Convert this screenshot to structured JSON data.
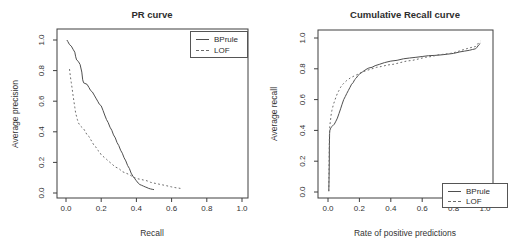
{
  "figure": {
    "background": "#ffffff",
    "frame_color": "#3f3f3f",
    "text_color": "#333333"
  },
  "chart_data": [
    {
      "type": "line",
      "title": "PR curve",
      "xlabel": "Recall",
      "ylabel": "Average precision",
      "xlim": [
        0.0,
        1.0
      ],
      "ylim": [
        0.0,
        1.0
      ],
      "grid": false,
      "legend_position": "top-right",
      "legend_labels": [
        "BPrule",
        "LOF"
      ],
      "xticks": [
        "0.0",
        "0.2",
        "0.4",
        "0.6",
        "0.8",
        "1.0"
      ],
      "yticks": [
        "0.0",
        "0.2",
        "0.4",
        "0.6",
        "0.8",
        "1.0"
      ],
      "series": [
        {
          "name": "BPrule",
          "style": "solid",
          "color": "#4f4f4f",
          "points": [
            [
              0.005,
              1.0
            ],
            [
              0.01,
              0.99
            ],
            [
              0.02,
              0.97
            ],
            [
              0.03,
              0.96
            ],
            [
              0.04,
              0.94
            ],
            [
              0.05,
              0.92
            ],
            [
              0.055,
              0.89
            ],
            [
              0.06,
              0.87
            ],
            [
              0.07,
              0.86
            ],
            [
              0.08,
              0.84
            ],
            [
              0.09,
              0.79
            ],
            [
              0.095,
              0.74
            ],
            [
              0.1,
              0.72
            ],
            [
              0.12,
              0.71
            ],
            [
              0.13,
              0.69
            ],
            [
              0.14,
              0.67
            ],
            [
              0.15,
              0.66
            ],
            [
              0.16,
              0.64
            ],
            [
              0.17,
              0.62
            ],
            [
              0.18,
              0.6
            ],
            [
              0.19,
              0.58
            ],
            [
              0.2,
              0.57
            ],
            [
              0.21,
              0.54
            ],
            [
              0.22,
              0.51
            ],
            [
              0.23,
              0.48
            ],
            [
              0.24,
              0.46
            ],
            [
              0.25,
              0.43
            ],
            [
              0.26,
              0.41
            ],
            [
              0.27,
              0.38
            ],
            [
              0.28,
              0.36
            ],
            [
              0.29,
              0.33
            ],
            [
              0.3,
              0.31
            ],
            [
              0.31,
              0.28
            ],
            [
              0.32,
              0.26
            ],
            [
              0.33,
              0.23
            ],
            [
              0.34,
              0.21
            ],
            [
              0.35,
              0.18
            ],
            [
              0.36,
              0.16
            ],
            [
              0.37,
              0.13
            ],
            [
              0.38,
              0.11
            ],
            [
              0.39,
              0.095
            ],
            [
              0.4,
              0.08
            ],
            [
              0.41,
              0.065
            ],
            [
              0.42,
              0.055
            ],
            [
              0.43,
              0.05
            ],
            [
              0.44,
              0.045
            ],
            [
              0.45,
              0.04
            ],
            [
              0.46,
              0.035
            ],
            [
              0.47,
              0.03
            ],
            [
              0.48,
              0.027
            ],
            [
              0.49,
              0.024
            ],
            [
              0.5,
              0.022
            ]
          ]
        },
        {
          "name": "LOF",
          "style": "dashed",
          "color": "#6b6b6b",
          "points": [
            [
              0.02,
              0.81
            ],
            [
              0.025,
              0.76
            ],
            [
              0.03,
              0.72
            ],
            [
              0.035,
              0.68
            ],
            [
              0.04,
              0.64
            ],
            [
              0.045,
              0.6
            ],
            [
              0.05,
              0.56
            ],
            [
              0.055,
              0.52
            ],
            [
              0.06,
              0.5
            ],
            [
              0.065,
              0.48
            ],
            [
              0.07,
              0.46
            ],
            [
              0.08,
              0.44
            ],
            [
              0.09,
              0.43
            ],
            [
              0.1,
              0.42
            ],
            [
              0.11,
              0.4
            ],
            [
              0.12,
              0.38
            ],
            [
              0.13,
              0.37
            ],
            [
              0.14,
              0.35
            ],
            [
              0.15,
              0.33
            ],
            [
              0.16,
              0.31
            ],
            [
              0.17,
              0.3
            ],
            [
              0.18,
              0.28
            ],
            [
              0.19,
              0.27
            ],
            [
              0.2,
              0.25
            ],
            [
              0.21,
              0.24
            ],
            [
              0.22,
              0.23
            ],
            [
              0.23,
              0.22
            ],
            [
              0.24,
              0.21
            ],
            [
              0.25,
              0.2
            ],
            [
              0.26,
              0.19
            ],
            [
              0.28,
              0.17
            ],
            [
              0.3,
              0.16
            ],
            [
              0.32,
              0.14
            ],
            [
              0.34,
              0.13
            ],
            [
              0.36,
              0.12
            ],
            [
              0.38,
              0.105
            ],
            [
              0.4,
              0.095
            ],
            [
              0.42,
              0.09
            ],
            [
              0.44,
              0.085
            ],
            [
              0.46,
              0.08
            ],
            [
              0.48,
              0.07
            ],
            [
              0.5,
              0.065
            ],
            [
              0.52,
              0.06
            ],
            [
              0.54,
              0.055
            ],
            [
              0.56,
              0.05
            ],
            [
              0.58,
              0.045
            ],
            [
              0.6,
              0.04
            ],
            [
              0.62,
              0.035
            ],
            [
              0.64,
              0.032
            ],
            [
              0.65,
              0.03
            ]
          ]
        }
      ]
    },
    {
      "type": "line",
      "title": "Cumulative Recall curve",
      "xlabel": "Rate of positive predictions",
      "ylabel": "Average recall",
      "xlim": [
        0.0,
        1.0
      ],
      "ylim": [
        0.0,
        1.0
      ],
      "grid": false,
      "legend_position": "bottom-right",
      "legend_labels": [
        "BPrule",
        "LOF"
      ],
      "xticks": [
        "0.0",
        "0.2",
        "0.4",
        "0.6",
        "0.8",
        "1.0"
      ],
      "yticks": [
        "0.0",
        "0.2",
        "0.4",
        "0.6",
        "0.8",
        "1.0"
      ],
      "series": [
        {
          "name": "BPrule",
          "style": "solid",
          "color": "#4f4f4f",
          "points": [
            [
              0.005,
              0.005
            ],
            [
              0.007,
              0.1
            ],
            [
              0.008,
              0.2
            ],
            [
              0.009,
              0.3
            ],
            [
              0.01,
              0.38
            ],
            [
              0.012,
              0.4
            ],
            [
              0.015,
              0.41
            ],
            [
              0.02,
              0.42
            ],
            [
              0.03,
              0.43
            ],
            [
              0.04,
              0.44
            ],
            [
              0.05,
              0.46
            ],
            [
              0.06,
              0.48
            ],
            [
              0.07,
              0.51
            ],
            [
              0.08,
              0.54
            ],
            [
              0.09,
              0.57
            ],
            [
              0.1,
              0.6
            ],
            [
              0.11,
              0.62
            ],
            [
              0.12,
              0.64
            ],
            [
              0.13,
              0.66
            ],
            [
              0.14,
              0.68
            ],
            [
              0.15,
              0.7
            ],
            [
              0.16,
              0.71
            ],
            [
              0.17,
              0.73
            ],
            [
              0.18,
              0.74
            ],
            [
              0.19,
              0.755
            ],
            [
              0.2,
              0.765
            ],
            [
              0.22,
              0.78
            ],
            [
              0.24,
              0.795
            ],
            [
              0.26,
              0.805
            ],
            [
              0.28,
              0.81
            ],
            [
              0.3,
              0.82
            ],
            [
              0.33,
              0.83
            ],
            [
              0.36,
              0.84
            ],
            [
              0.4,
              0.85
            ],
            [
              0.44,
              0.855
            ],
            [
              0.48,
              0.865
            ],
            [
              0.52,
              0.87
            ],
            [
              0.56,
              0.875
            ],
            [
              0.6,
              0.88
            ],
            [
              0.64,
              0.885
            ],
            [
              0.68,
              0.887
            ],
            [
              0.72,
              0.89
            ],
            [
              0.76,
              0.895
            ],
            [
              0.8,
              0.9
            ],
            [
              0.84,
              0.91
            ],
            [
              0.87,
              0.915
            ],
            [
              0.9,
              0.92
            ],
            [
              0.92,
              0.925
            ],
            [
              0.94,
              0.93
            ],
            [
              0.95,
              0.94
            ],
            [
              0.96,
              0.955
            ],
            [
              0.97,
              0.965
            ]
          ]
        },
        {
          "name": "LOF",
          "style": "dashed",
          "color": "#6b6b6b",
          "points": [
            [
              0.005,
              0.005
            ],
            [
              0.006,
              0.1
            ],
            [
              0.007,
              0.2
            ],
            [
              0.008,
              0.3
            ],
            [
              0.009,
              0.36
            ],
            [
              0.01,
              0.42
            ],
            [
              0.015,
              0.46
            ],
            [
              0.02,
              0.5
            ],
            [
              0.025,
              0.53
            ],
            [
              0.03,
              0.55
            ],
            [
              0.035,
              0.57
            ],
            [
              0.04,
              0.585
            ],
            [
              0.045,
              0.6
            ],
            [
              0.05,
              0.615
            ],
            [
              0.06,
              0.64
            ],
            [
              0.07,
              0.66
            ],
            [
              0.08,
              0.68
            ],
            [
              0.09,
              0.695
            ],
            [
              0.1,
              0.705
            ],
            [
              0.11,
              0.715
            ],
            [
              0.12,
              0.725
            ],
            [
              0.13,
              0.73
            ],
            [
              0.14,
              0.74
            ],
            [
              0.15,
              0.745
            ],
            [
              0.16,
              0.75
            ],
            [
              0.18,
              0.76
            ],
            [
              0.2,
              0.77
            ],
            [
              0.22,
              0.78
            ],
            [
              0.25,
              0.79
            ],
            [
              0.28,
              0.8
            ],
            [
              0.31,
              0.81
            ],
            [
              0.34,
              0.815
            ],
            [
              0.38,
              0.825
            ],
            [
              0.42,
              0.83
            ],
            [
              0.46,
              0.84
            ],
            [
              0.5,
              0.85
            ],
            [
              0.54,
              0.855
            ],
            [
              0.58,
              0.865
            ],
            [
              0.62,
              0.875
            ],
            [
              0.66,
              0.88
            ],
            [
              0.7,
              0.89
            ],
            [
              0.74,
              0.895
            ],
            [
              0.78,
              0.9
            ],
            [
              0.82,
              0.91
            ],
            [
              0.85,
              0.92
            ],
            [
              0.88,
              0.93
            ],
            [
              0.9,
              0.935
            ],
            [
              0.92,
              0.94
            ],
            [
              0.94,
              0.945
            ],
            [
              0.95,
              0.955
            ],
            [
              0.96,
              0.97
            ],
            [
              0.97,
              0.98
            ]
          ]
        }
      ]
    }
  ]
}
